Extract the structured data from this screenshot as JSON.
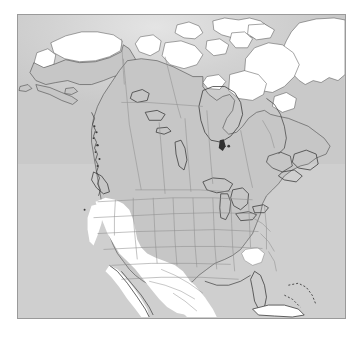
{
  "map": {
    "title": "North America distribution map",
    "projection_note": "Lambert conformal / polar-style North America extent",
    "colors": {
      "page_background": "#ffffff",
      "ocean": "#cfcfcf",
      "land": "#c6c6c6",
      "highlight": "#ffffff",
      "coastline": "#4a4a4a",
      "internal_border": "#8f8f8f",
      "frame_border": "#9a9a9a",
      "lake_outline": "#3c3c3c"
    },
    "frame": {
      "x": 17,
      "y": 14,
      "width": 329,
      "height": 305
    },
    "legend_visible": false,
    "labels_visible": false,
    "graticule_visible": false,
    "highlighted_regions": [
      "Northern Alaska",
      "Canadian Arctic Archipelago",
      "Greenland",
      "Baffin Island",
      "Ungava / Quebec coast",
      "California",
      "Nevada",
      "Utah",
      "Arizona",
      "Baja California",
      "Northwest Mexico",
      "South Carolina"
    ],
    "features": [
      "Great Lakes",
      "Hudson Bay",
      "Great Bear Lake",
      "Great Slave Lake",
      "Lake Winnipeg",
      "Gulf of Mexico",
      "Cuba",
      "Bahamas",
      "Gulf of California",
      "Aleutian Islands",
      "Newfoundland",
      "Nova Scotia",
      "Vancouver Island"
    ],
    "country_boundaries": [
      "United States",
      "Canada",
      "Mexico"
    ],
    "subdivision_boundaries_shown": true
  }
}
